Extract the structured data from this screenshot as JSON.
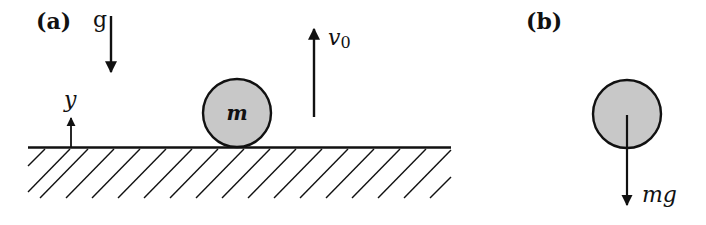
{
  "figure": {
    "panel_a": {
      "label": "(a)",
      "gravity_label": "g",
      "axis_label": "y",
      "velocity_label": "v",
      "velocity_subscript": "0",
      "mass_label": "m"
    },
    "panel_b": {
      "label": "(b)",
      "force_label": "mg"
    }
  },
  "colors": {
    "ink": "#111111",
    "ball_fill": "#c8c8c8",
    "background": "#ffffff"
  }
}
